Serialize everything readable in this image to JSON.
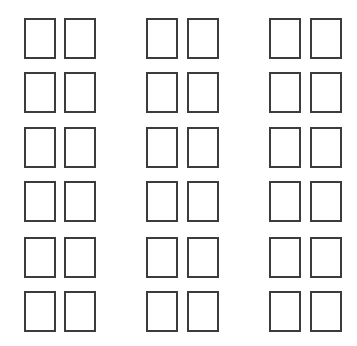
{
  "diagram": {
    "type": "grid-of-outlined-rectangles",
    "background": "#ffffff",
    "stroke_color": "#3c3c3c",
    "stroke_width": 2,
    "cell_width": 32,
    "cell_height": 41,
    "groups": [
      {
        "name": "left-group",
        "columns_x": [
          24,
          64
        ]
      },
      {
        "name": "middle-group",
        "columns_x": [
          146,
          187
        ]
      },
      {
        "name": "right-group",
        "columns_x": [
          269,
          310
        ]
      }
    ],
    "rows_y": [
      18,
      72,
      127,
      181,
      237,
      291
    ],
    "total_cells": 36
  }
}
